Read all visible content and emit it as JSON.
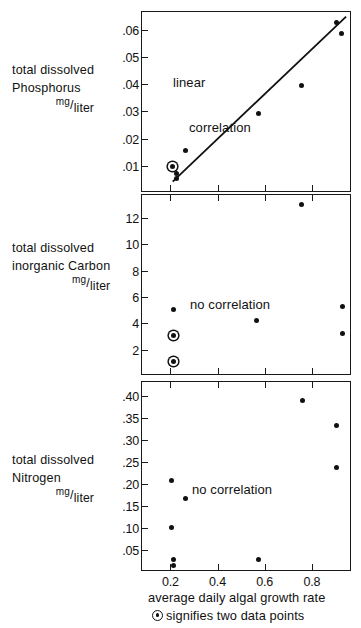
{
  "figure": {
    "xaxis_title": "average daily algal growth rate",
    "caption": "signifies two data points",
    "caption_symbol": "circled-dot",
    "x_ticks": [
      "0.2",
      "0.4",
      "0.6",
      "0.8"
    ],
    "x_tick_values": [
      0.2,
      0.4,
      0.6,
      0.8
    ],
    "x_range": [
      0.08,
      0.97
    ]
  },
  "panels": [
    {
      "id": "phosphorus",
      "label_lines": [
        "total dissolved",
        "Phosphorus"
      ],
      "units_numerator": "mg",
      "units_denominator": "liter",
      "annotation_lines": [
        "linear",
        "correlation"
      ],
      "y_ticks": [
        ".06",
        ".05",
        ".04",
        ".03",
        ".02",
        ".01"
      ],
      "y_tick_values": [
        0.06,
        0.05,
        0.04,
        0.03,
        0.02,
        0.01
      ],
      "y_range": [
        0.0,
        0.0665
      ]
    },
    {
      "id": "carbon",
      "label_lines": [
        "total dissolved",
        "inorganic Carbon"
      ],
      "units_numerator": "mg",
      "units_denominator": "liter",
      "annotation_lines": [
        "no correlation"
      ],
      "y_ticks": [
        "12",
        "10",
        "8",
        "6",
        "4",
        "2"
      ],
      "y_tick_values": [
        12,
        10,
        8,
        6,
        4,
        2
      ],
      "y_range": [
        0.0,
        13.75
      ]
    },
    {
      "id": "nitrogen",
      "label_lines": [
        "total dissolved",
        "Nitrogen"
      ],
      "units_numerator": "mg",
      "units_denominator": "liter",
      "annotation_lines": [
        "no correlation"
      ],
      "y_ticks": [
        ".40",
        ".35",
        ".30",
        ".25",
        ".20",
        ".15",
        ".10",
        ".05"
      ],
      "y_tick_values": [
        0.4,
        0.35,
        0.3,
        0.25,
        0.2,
        0.15,
        0.1,
        0.05
      ],
      "y_range": [
        0.0,
        0.432
      ]
    }
  ],
  "chart_data": [
    {
      "type": "scatter",
      "title": "total dissolved Phosphorus mg/liter",
      "xlabel": "average daily algal growth rate",
      "ylabel": "total dissolved Phosphorus mg/liter",
      "annotation": "linear correlation",
      "xlim": [
        0.08,
        0.97
      ],
      "ylim": [
        0.0,
        0.0665
      ],
      "xticks": [
        0.2,
        0.4,
        0.6,
        0.8
      ],
      "yticks": [
        0.01,
        0.02,
        0.03,
        0.04,
        0.05,
        0.06
      ],
      "grid": false,
      "legend": "none",
      "points": [
        {
          "x": 0.21,
          "y": 0.0098,
          "double": true
        },
        {
          "x": 0.225,
          "y": 0.0073,
          "double": false
        },
        {
          "x": 0.227,
          "y": 0.0055,
          "double": false
        },
        {
          "x": 0.265,
          "y": 0.0155,
          "double": false
        },
        {
          "x": 0.575,
          "y": 0.0293,
          "double": false
        },
        {
          "x": 0.755,
          "y": 0.0395,
          "double": false
        },
        {
          "x": 0.905,
          "y": 0.0625,
          "double": false
        },
        {
          "x": 0.925,
          "y": 0.0588,
          "double": false
        }
      ],
      "fit_line": {
        "x0": 0.21,
        "y0": 0.0042,
        "x1": 0.945,
        "y1": 0.0648
      }
    },
    {
      "type": "scatter",
      "title": "total dissolved inorganic Carbon mg/liter",
      "xlabel": "average daily algal growth rate",
      "ylabel": "total dissolved inorganic Carbon mg/liter",
      "annotation": "no correlation",
      "xlim": [
        0.08,
        0.97
      ],
      "ylim": [
        0.0,
        13.75
      ],
      "xticks": [
        0.2,
        0.4,
        0.6,
        0.8
      ],
      "yticks": [
        2,
        4,
        6,
        8,
        10,
        12
      ],
      "grid": false,
      "legend": "none",
      "points": [
        {
          "x": 0.215,
          "y": 5.05,
          "double": false
        },
        {
          "x": 0.215,
          "y": 3.05,
          "double": true
        },
        {
          "x": 0.215,
          "y": 1.1,
          "double": true
        },
        {
          "x": 0.565,
          "y": 4.25,
          "double": false
        },
        {
          "x": 0.755,
          "y": 13.05,
          "double": false
        },
        {
          "x": 0.93,
          "y": 5.3,
          "double": false
        },
        {
          "x": 0.93,
          "y": 3.25,
          "double": false
        }
      ]
    },
    {
      "type": "scatter",
      "title": "total dissolved Nitrogen mg/liter",
      "xlabel": "average daily algal growth rate",
      "ylabel": "total dissolved Nitrogen mg/liter",
      "annotation": "no correlation",
      "xlim": [
        0.08,
        0.97
      ],
      "ylim": [
        0.0,
        0.432
      ],
      "xticks": [
        0.2,
        0.4,
        0.6,
        0.8
      ],
      "yticks": [
        0.05,
        0.1,
        0.15,
        0.2,
        0.25,
        0.3,
        0.35,
        0.4
      ],
      "grid": false,
      "legend": "none",
      "points": [
        {
          "x": 0.205,
          "y": 0.208,
          "double": false
        },
        {
          "x": 0.205,
          "y": 0.102,
          "double": false
        },
        {
          "x": 0.212,
          "y": 0.028,
          "double": false
        },
        {
          "x": 0.212,
          "y": 0.016,
          "double": false
        },
        {
          "x": 0.265,
          "y": 0.168,
          "double": false
        },
        {
          "x": 0.575,
          "y": 0.028,
          "double": false
        },
        {
          "x": 0.76,
          "y": 0.389,
          "double": false
        },
        {
          "x": 0.905,
          "y": 0.333,
          "double": false
        },
        {
          "x": 0.905,
          "y": 0.238,
          "double": false
        }
      ]
    }
  ]
}
